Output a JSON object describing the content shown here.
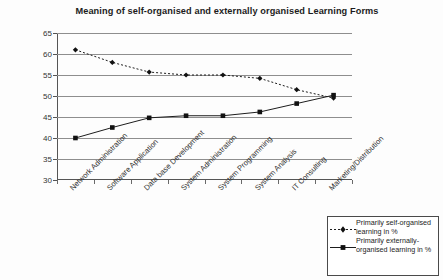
{
  "chart_data": {
    "type": "line",
    "title": "Meaning of self-organised and externally organised Learning Forms",
    "xlabel": "",
    "ylabel": "",
    "ylim": [
      30,
      65
    ],
    "ytick_step": 5,
    "yticks": [
      65,
      60,
      55,
      50,
      45,
      40,
      35,
      30
    ],
    "grid": true,
    "legend_position": "bottom-right",
    "categories": [
      "Network Administration",
      "Software Application",
      "Data base Development",
      "System Administration",
      "System Programming",
      "System Analysis",
      "IT Consulting",
      "Marketing/Distribution"
    ],
    "series": [
      {
        "name": "Primarily self-organised learning in %",
        "marker": "diamond",
        "line_style": "dotted",
        "values": [
          61,
          58,
          55.7,
          55,
          55,
          54.2,
          51.5,
          49.5
        ]
      },
      {
        "name": "Primarily externally-organised learning in %",
        "marker": "square",
        "line_style": "solid",
        "values": [
          40,
          42.5,
          44.8,
          45.3,
          45.3,
          46.2,
          48.2,
          50.2
        ]
      }
    ]
  },
  "legend": {
    "entries": [
      "Primarily self-organised learning in %",
      "Primarily externally-organised learning in %"
    ]
  },
  "colors": {
    "line": "#1d1d1d",
    "grid": "#8e8e8e",
    "axis": "#555555",
    "background": "#fdfdfd"
  }
}
